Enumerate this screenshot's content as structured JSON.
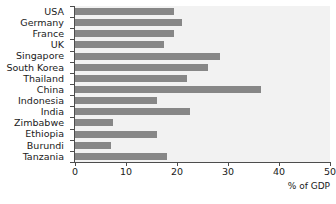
{
  "chart_data": {
    "type": "bar",
    "orientation": "horizontal",
    "title": "",
    "xlabel": "% of GDP",
    "ylabel": "",
    "xlim": [
      0,
      50
    ],
    "xticks": [
      0,
      10,
      20,
      30,
      40,
      50
    ],
    "xticklabels": [
      "0",
      "10",
      "20",
      "30",
      "40",
      "50"
    ],
    "grid": false,
    "legend": false,
    "categories": [
      "USA",
      "Germany",
      "France",
      "UK",
      "Singapore",
      "South Korea",
      "Thailand",
      "China",
      "Indonesia",
      "India",
      "Zimbabwe",
      "Ethiopia",
      "Burundi",
      "Tanzania"
    ],
    "values": [
      19.5,
      21,
      19.5,
      17.5,
      28.5,
      26,
      22,
      36.5,
      16,
      22.5,
      7.5,
      16,
      7,
      18
    ],
    "series": [
      {
        "name": "% of GDP",
        "values": [
          19.5,
          21,
          19.5,
          17.5,
          28.5,
          26,
          22,
          36.5,
          16,
          22.5,
          7.5,
          16,
          7,
          18
        ]
      }
    ]
  },
  "style": {
    "bar_color": "#878787",
    "plot_background": "#f2f2f2",
    "figure_background": "#ffffff",
    "axis_color": "#4d4d4d",
    "text_color": "#1a1a1a"
  }
}
